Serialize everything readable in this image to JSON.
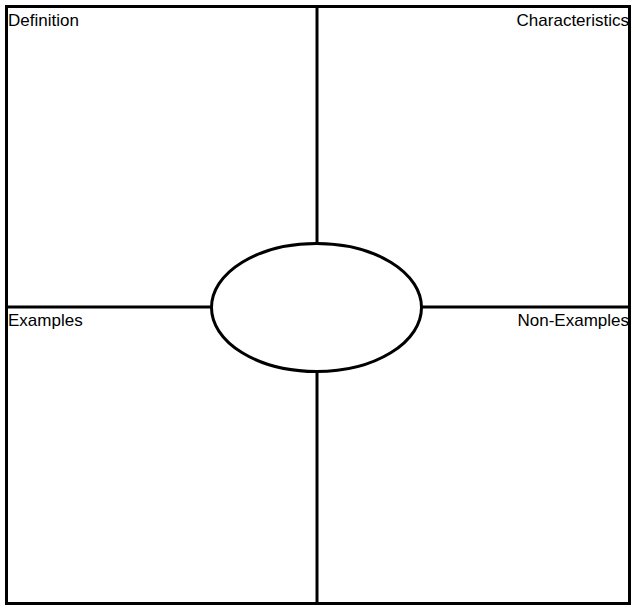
{
  "page": {
    "background_color": "#ffffff",
    "stroke_color": "#000000",
    "text_color": "#000000",
    "width": 636,
    "height": 611
  },
  "organizer": {
    "type": "frayer-model",
    "center": {
      "shape": "ellipse",
      "fill": "#ffffff",
      "text": "",
      "placeholder": ""
    },
    "quadrants": [
      {
        "id": "definition",
        "label": "Definition",
        "position": "top-left",
        "label_align": "left",
        "content": ""
      },
      {
        "id": "characteristics",
        "label": "Characteristics",
        "position": "top-right",
        "label_align": "right",
        "content": ""
      },
      {
        "id": "examples",
        "label": "Examples",
        "position": "bottom-left",
        "label_align": "left",
        "content": ""
      },
      {
        "id": "non-examples",
        "label": "Non-Examples",
        "position": "bottom-right",
        "label_align": "right",
        "content": ""
      }
    ]
  }
}
